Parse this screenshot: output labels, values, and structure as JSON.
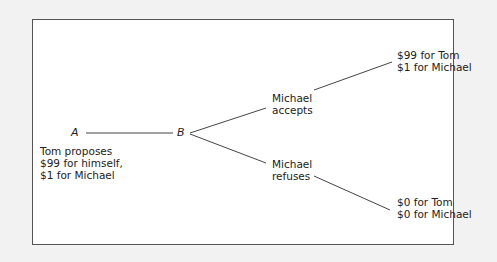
{
  "diagram": {
    "type": "game-tree",
    "colors": {
      "background": "#f2f2f2",
      "panel": "#ffffff",
      "border": "#555555",
      "line": "#444444",
      "text": "#222222"
    },
    "nodes": {
      "a": {
        "label": "A",
        "description": [
          "Tom proposes",
          "$99 for himself,",
          "$1 for Michael"
        ]
      },
      "b": {
        "label": "B"
      }
    },
    "branches": {
      "accept": {
        "label": [
          "Michael",
          "accepts"
        ],
        "outcome": [
          "$99 for Tom",
          "$1 for Michael"
        ]
      },
      "refuse": {
        "label": [
          "Michael",
          "refuses"
        ],
        "outcome": [
          "$0 for Tom",
          "$0 for Michael"
        ]
      }
    }
  }
}
